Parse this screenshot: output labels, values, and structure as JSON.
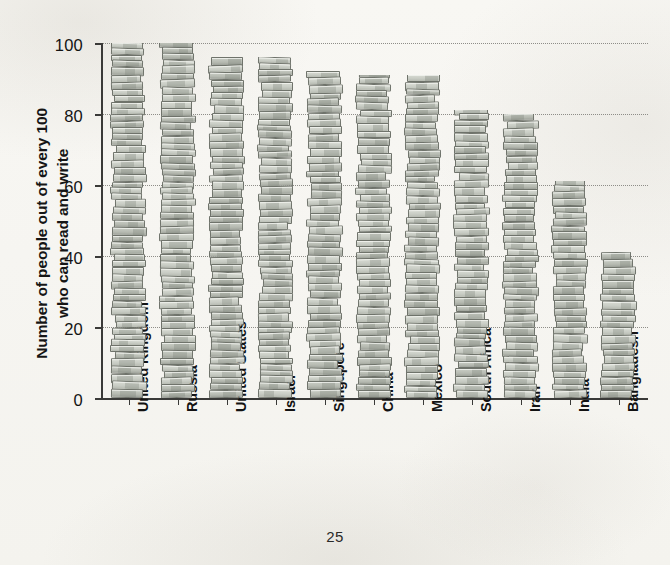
{
  "page": {
    "number": "25",
    "background_color": "#f7f6f2"
  },
  "chart_data": {
    "type": "bar",
    "title": "",
    "subtitle": "",
    "xlabel": "",
    "ylabel": "Number of people out of every 100\nwho can read and write",
    "ylim": [
      0,
      100
    ],
    "yticks": [
      0,
      20,
      40,
      60,
      80,
      100
    ],
    "ytick_labels": [
      "0",
      "20",
      "40",
      "60",
      "80",
      "100"
    ],
    "grid": "horizontal-dotted",
    "legend": "none",
    "bar_style": "pictorial-stacked-books",
    "bar_colors": {
      "book_face_light": "#c9cdc5",
      "book_face_mid": "#b6bab1",
      "book_spine_dark": "#9ea29a",
      "book_outline": "#6f736b",
      "book_highlight": "#d8dbd3"
    },
    "categories": [
      "United Kingdom",
      "Russia",
      "United States",
      "Israel",
      "Singapore",
      "China",
      "Mexico",
      "South Africa",
      "Iran",
      "India",
      "Bangladesh"
    ],
    "values": [
      100,
      100,
      96,
      96,
      92,
      91,
      91,
      81,
      80,
      61,
      41
    ]
  }
}
